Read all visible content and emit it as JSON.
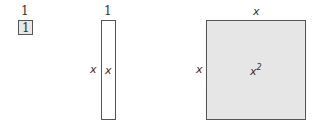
{
  "diagram": {
    "unit_tile": {
      "top_label": "1",
      "inner_label": "1",
      "fill": "#e8e8e8"
    },
    "x_tile": {
      "top_label": "1",
      "side_label": "x",
      "inner_label": "x",
      "fill": "#ffffff"
    },
    "x2_tile": {
      "top_label": "x",
      "side_label": "x",
      "inner_label": "x",
      "inner_exponent": "2",
      "fill": "#e6e6e6"
    }
  }
}
